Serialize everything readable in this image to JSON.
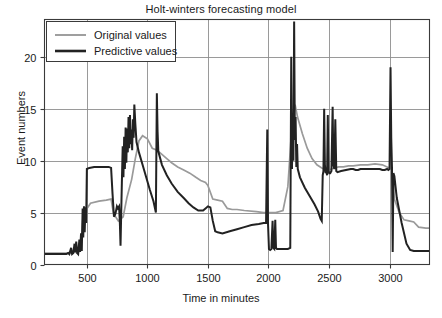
{
  "chart_data": {
    "type": "line",
    "title": "Holt-winters forecasting model",
    "xlabel": "Time in minutes",
    "ylabel": "Event numbers",
    "xlim": [
      150,
      3330
    ],
    "ylim": [
      0,
      23.6
    ],
    "xticks": [
      500,
      1000,
      1500,
      2000,
      2500,
      3000
    ],
    "yticks": [
      0,
      5,
      10,
      15,
      20
    ],
    "grid": true,
    "legend_position": "top-left",
    "colors": {
      "original": "#9a9a9a",
      "predictive": "#222222",
      "grid": "#8e8e8e",
      "frame": "#3a3a3a"
    },
    "series": [
      {
        "name": "Original values",
        "color": "#9a9a9a",
        "width": 1.7,
        "points": [
          [
            150,
            1.1
          ],
          [
            380,
            1.1
          ],
          [
            400,
            1.2
          ],
          [
            420,
            1.1
          ],
          [
            450,
            1.4
          ],
          [
            470,
            4.9
          ],
          [
            490,
            5.2
          ],
          [
            530,
            5.9
          ],
          [
            600,
            6.1
          ],
          [
            660,
            6.2
          ],
          [
            700,
            6.3
          ],
          [
            720,
            4.9
          ],
          [
            760,
            4.2
          ],
          [
            800,
            4.6
          ],
          [
            830,
            6.4
          ],
          [
            870,
            8.2
          ],
          [
            900,
            10.2
          ],
          [
            930,
            11.9
          ],
          [
            960,
            12.4
          ],
          [
            1000,
            12.1
          ],
          [
            1040,
            11.2
          ],
          [
            1080,
            11.0
          ],
          [
            1120,
            10.6
          ],
          [
            1160,
            10.2
          ],
          [
            1200,
            9.8
          ],
          [
            1250,
            9.4
          ],
          [
            1300,
            9.1
          ],
          [
            1350,
            8.8
          ],
          [
            1400,
            8.4
          ],
          [
            1440,
            8.1
          ],
          [
            1480,
            7.9
          ],
          [
            1500,
            7.6
          ],
          [
            1540,
            6.3
          ],
          [
            1580,
            6.2
          ],
          [
            1620,
            6.1
          ],
          [
            1660,
            5.4
          ],
          [
            1700,
            5.3
          ],
          [
            1740,
            5.3
          ],
          [
            1800,
            5.2
          ],
          [
            1900,
            5.1
          ],
          [
            1960,
            5.0
          ],
          [
            1990,
            5.0
          ],
          [
            2000,
            5.0
          ],
          [
            2060,
            5.0
          ],
          [
            2120,
            5.2
          ],
          [
            2160,
            7.5
          ],
          [
            2180,
            11.0
          ],
          [
            2200,
            14.6
          ],
          [
            2220,
            15.4
          ],
          [
            2240,
            14.2
          ],
          [
            2280,
            12.6
          ],
          [
            2320,
            11.2
          ],
          [
            2360,
            10.2
          ],
          [
            2400,
            9.6
          ],
          [
            2440,
            9.3
          ],
          [
            2460,
            9.2
          ],
          [
            2500,
            9.1
          ],
          [
            2540,
            9.3
          ],
          [
            2580,
            9.4
          ],
          [
            2620,
            9.4
          ],
          [
            2660,
            9.5
          ],
          [
            2700,
            9.5
          ],
          [
            2760,
            9.6
          ],
          [
            2820,
            9.6
          ],
          [
            2880,
            9.7
          ],
          [
            2940,
            9.6
          ],
          [
            2980,
            9.4
          ],
          [
            3000,
            9.3
          ],
          [
            3020,
            9.2
          ],
          [
            3040,
            6.3
          ],
          [
            3080,
            5.0
          ],
          [
            3120,
            4.3
          ],
          [
            3160,
            4.2
          ],
          [
            3200,
            4.1
          ],
          [
            3240,
            3.6
          ],
          [
            3300,
            3.5
          ],
          [
            3330,
            3.5
          ]
        ]
      },
      {
        "name": "Predictive values",
        "color": "#222222",
        "width": 2.0,
        "points": [
          [
            150,
            1.0
          ],
          [
            330,
            1.0
          ],
          [
            345,
            1.1
          ],
          [
            355,
            1.0
          ],
          [
            370,
            1.6
          ],
          [
            378,
            1.0
          ],
          [
            388,
            1.1
          ],
          [
            398,
            2.0
          ],
          [
            405,
            1.2
          ],
          [
            412,
            2.2
          ],
          [
            420,
            1.1
          ],
          [
            428,
            1.0
          ],
          [
            438,
            2.4
          ],
          [
            444,
            1.2
          ],
          [
            452,
            3.0
          ],
          [
            458,
            1.3
          ],
          [
            465,
            5.4
          ],
          [
            470,
            2.6
          ],
          [
            476,
            5.6
          ],
          [
            482,
            3.1
          ],
          [
            488,
            5.5
          ],
          [
            494,
            4.0
          ],
          [
            500,
            9.2
          ],
          [
            520,
            9.3
          ],
          [
            560,
            9.4
          ],
          [
            600,
            9.4
          ],
          [
            640,
            9.4
          ],
          [
            680,
            9.4
          ],
          [
            700,
            9.3
          ],
          [
            712,
            6.8
          ],
          [
            724,
            4.6
          ],
          [
            736,
            4.9
          ],
          [
            748,
            5.6
          ],
          [
            756,
            5.4
          ],
          [
            766,
            5.6
          ],
          [
            772,
            4.2
          ],
          [
            778,
            1.8
          ],
          [
            784,
            5.2
          ],
          [
            790,
            8.4
          ],
          [
            796,
            11.4
          ],
          [
            802,
            8.4
          ],
          [
            808,
            12.3
          ],
          [
            814,
            9.2
          ],
          [
            820,
            13.2
          ],
          [
            826,
            9.8
          ],
          [
            832,
            13.1
          ],
          [
            838,
            10.8
          ],
          [
            844,
            14.2
          ],
          [
            850,
            11.2
          ],
          [
            856,
            14.4
          ],
          [
            862,
            11.6
          ],
          [
            868,
            13.0
          ],
          [
            874,
            11.0
          ],
          [
            880,
            14.0
          ],
          [
            886,
            12.2
          ],
          [
            892,
            15.4
          ],
          [
            900,
            13.6
          ],
          [
            910,
            11.8
          ],
          [
            930,
            10.8
          ],
          [
            960,
            9.6
          ],
          [
            990,
            8.4
          ],
          [
            1020,
            7.2
          ],
          [
            1050,
            6.1
          ],
          [
            1070,
            5.0
          ],
          [
            1078,
            16.5
          ],
          [
            1084,
            12.8
          ],
          [
            1090,
            10.9
          ],
          [
            1120,
            9.6
          ],
          [
            1160,
            8.6
          ],
          [
            1200,
            7.8
          ],
          [
            1250,
            7.0
          ],
          [
            1300,
            6.4
          ],
          [
            1340,
            5.9
          ],
          [
            1380,
            5.5
          ],
          [
            1420,
            5.2
          ],
          [
            1460,
            5.2
          ],
          [
            1480,
            5.4
          ],
          [
            1500,
            5.6
          ],
          [
            1520,
            5.5
          ],
          [
            1540,
            4.2
          ],
          [
            1560,
            3.2
          ],
          [
            1580,
            3.1
          ],
          [
            1620,
            3.0
          ],
          [
            1680,
            3.2
          ],
          [
            1740,
            3.4
          ],
          [
            1800,
            3.6
          ],
          [
            1860,
            3.8
          ],
          [
            1920,
            3.9
          ],
          [
            1960,
            4.0
          ],
          [
            1980,
            4.0
          ],
          [
            1990,
            13.0
          ],
          [
            1996,
            4.0
          ],
          [
            2004,
            1.5
          ],
          [
            2014,
            1.4
          ],
          [
            2024,
            1.5
          ],
          [
            2034,
            4.2
          ],
          [
            2040,
            1.6
          ],
          [
            2048,
            1.5
          ],
          [
            2056,
            4.3
          ],
          [
            2062,
            1.6
          ],
          [
            2070,
            1.5
          ],
          [
            2080,
            1.5
          ],
          [
            2120,
            1.5
          ],
          [
            2160,
            1.5
          ],
          [
            2180,
            1.6
          ],
          [
            2188,
            20.0
          ],
          [
            2194,
            9.2
          ],
          [
            2200,
            14.6
          ],
          [
            2206,
            10.0
          ],
          [
            2212,
            23.4
          ],
          [
            2218,
            12.0
          ],
          [
            2224,
            14.2
          ],
          [
            2230,
            9.4
          ],
          [
            2236,
            11.6
          ],
          [
            2242,
            9.2
          ],
          [
            2260,
            8.4
          ],
          [
            2300,
            7.4
          ],
          [
            2340,
            6.6
          ],
          [
            2380,
            5.8
          ],
          [
            2410,
            5.1
          ],
          [
            2430,
            4.4
          ],
          [
            2440,
            4.2
          ],
          [
            2448,
            8.6
          ],
          [
            2454,
            9.0
          ],
          [
            2460,
            15.0
          ],
          [
            2466,
            9.6
          ],
          [
            2472,
            8.8
          ],
          [
            2478,
            9.0
          ],
          [
            2484,
            8.6
          ],
          [
            2490,
            14.4
          ],
          [
            2496,
            9.0
          ],
          [
            2502,
            8.8
          ],
          [
            2510,
            8.8
          ],
          [
            2520,
            9.0
          ],
          [
            2530,
            15.2
          ],
          [
            2536,
            9.6
          ],
          [
            2544,
            9.2
          ],
          [
            2552,
            14.0
          ],
          [
            2560,
            9.0
          ],
          [
            2570,
            8.9
          ],
          [
            2600,
            9.0
          ],
          [
            2640,
            9.1
          ],
          [
            2680,
            9.2
          ],
          [
            2700,
            9.2
          ],
          [
            2720,
            9.1
          ],
          [
            2740,
            9.1
          ],
          [
            2760,
            9.2
          ],
          [
            2800,
            9.2
          ],
          [
            2840,
            9.2
          ],
          [
            2880,
            9.2
          ],
          [
            2900,
            9.2
          ],
          [
            2920,
            9.2
          ],
          [
            2940,
            9.1
          ],
          [
            2960,
            9.1
          ],
          [
            2980,
            9.2
          ],
          [
            2990,
            9.1
          ],
          [
            3000,
            9.2
          ],
          [
            3008,
            19.0
          ],
          [
            3014,
            12.2
          ],
          [
            3020,
            9.4
          ],
          [
            3026,
            1.2
          ],
          [
            3032,
            8.8
          ],
          [
            3040,
            8.5
          ],
          [
            3060,
            6.4
          ],
          [
            3100,
            4.0
          ],
          [
            3140,
            2.0
          ],
          [
            3170,
            1.4
          ],
          [
            3200,
            1.3
          ],
          [
            3260,
            1.3
          ],
          [
            3330,
            1.3
          ]
        ]
      }
    ]
  },
  "legend": {
    "entries": [
      {
        "label": "Original values",
        "color": "#9a9a9a"
      },
      {
        "label": "Predictive values",
        "color": "#222222"
      }
    ]
  }
}
